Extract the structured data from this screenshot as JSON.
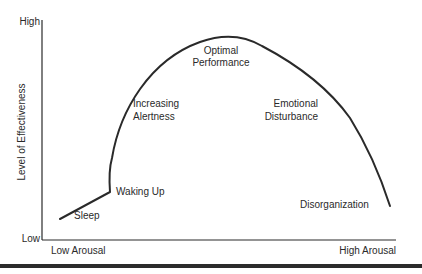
{
  "diagram": {
    "y_axis": {
      "label": "Level of Effectiveness",
      "high": "High",
      "low": "Low"
    },
    "x_axis": {
      "low": "Low Arousal",
      "high": "High Arousal"
    },
    "stages": [
      {
        "id": "sleep",
        "label": "Sleep"
      },
      {
        "id": "waking-up",
        "label": "Waking Up"
      },
      {
        "id": "increasing-alertness",
        "label_line1": "Increasing",
        "label_line2": "Alertness"
      },
      {
        "id": "optimal-performance",
        "label_line1": "Optimal",
        "label_line2": "Performance"
      },
      {
        "id": "emotional-disturbance",
        "label_line1": "Emotional",
        "label_line2": "Disturbance"
      },
      {
        "id": "disorganization",
        "label": "Disorganization"
      }
    ],
    "colors": {
      "ink": "#2a2a2a",
      "background": "#ffffff"
    }
  }
}
